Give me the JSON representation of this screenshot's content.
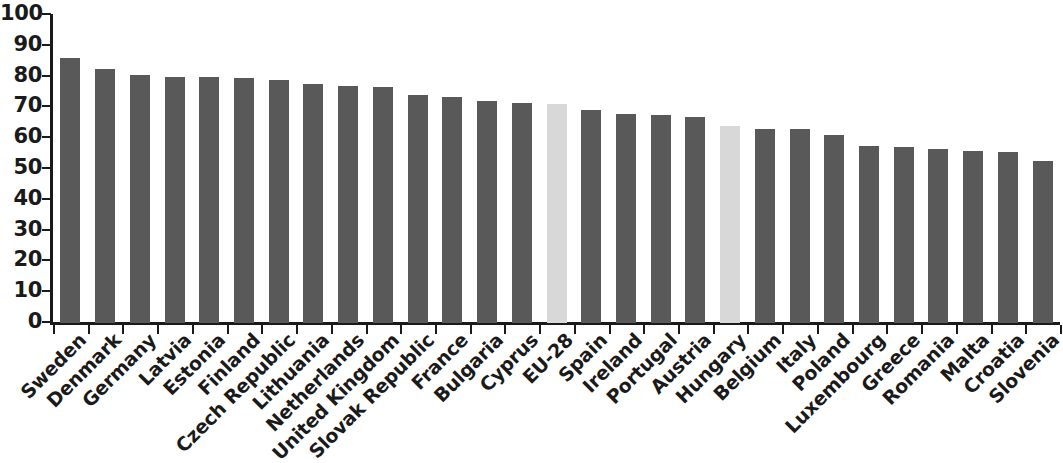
{
  "chart_data": {
    "type": "bar",
    "title": "",
    "subtitle": "",
    "xlabel": "",
    "ylabel": "",
    "ylim": [
      0,
      100
    ],
    "ytick_labels": [
      "100",
      "90",
      "80",
      "70",
      "60",
      "50",
      "40",
      "30",
      "20",
      "10",
      "0"
    ],
    "ytick_values": [
      100,
      90,
      80,
      70,
      60,
      50,
      40,
      30,
      20,
      10,
      0
    ],
    "grid": false,
    "legend": null,
    "legend_position": "none",
    "bar_color_default": "#595959",
    "bar_color_highlight": "#d8d8d8",
    "axis_color": "#1a1a1a",
    "background_color": "#ffffff",
    "categories": [
      "Sweden",
      "Denmark",
      "Germany",
      "Latvia",
      "Estonia",
      "Finland",
      "Czech Republic",
      "Lithuania",
      "Netherlands",
      "United Kingdom",
      "Slovak Republic",
      "France",
      "Bulgaria",
      "Cyprus",
      "EU-28",
      "Spain",
      "Ireland",
      "Portugal",
      "Austria",
      "Hungary",
      "Belgium",
      "Italy",
      "Poland",
      "Luxembourg",
      "Greece",
      "Romania",
      "Malta",
      "Croatia",
      "Slovenia"
    ],
    "values": [
      86,
      82.5,
      80.5,
      80,
      80,
      79.5,
      79,
      77.5,
      77,
      76.5,
      74,
      73.5,
      72,
      71.5,
      71,
      69,
      68,
      67.5,
      67,
      64,
      63,
      63,
      61,
      57.5,
      57,
      56.5,
      56,
      55.5,
      52.5
    ],
    "highlighted": [
      "EU-28",
      "Hungary"
    ]
  }
}
